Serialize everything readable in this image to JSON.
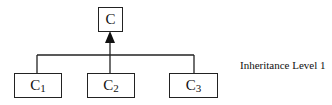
{
  "diagram": {
    "type": "class-inheritance-tree",
    "parent": {
      "name": "C"
    },
    "children": [
      {
        "name": "C",
        "subscript": "1"
      },
      {
        "name": "C",
        "subscript": "2"
      },
      {
        "name": "C",
        "subscript": "3"
      }
    ],
    "edge_style": "arrow-to-parent",
    "annotation": "Inheritance Level 1",
    "colors": {
      "stroke": "#222222",
      "background": "#ffffff"
    }
  }
}
